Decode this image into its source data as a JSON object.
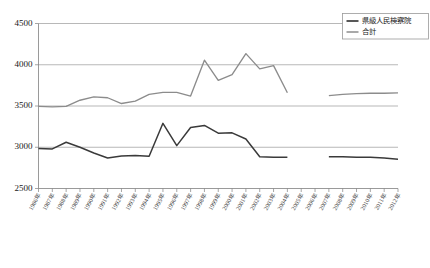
{
  "chart_data": {
    "type": "line",
    "title": "",
    "subtitle": "",
    "xlabel": "",
    "ylabel": "",
    "grid": true,
    "legend_position": "top-right",
    "ylim": [
      2500,
      4500
    ],
    "yticks": [
      "2500",
      "3000",
      "3500",
      "4000",
      "4500"
    ],
    "ytick_values": [
      2500,
      3000,
      3500,
      4000,
      4500
    ],
    "categories": [
      "1986年",
      "1987年",
      "1988年",
      "1989年",
      "1990年",
      "1991年",
      "1992年",
      "1993年",
      "1994年",
      "1995年",
      "1996年",
      "1997年",
      "1998年",
      "1999年",
      "2000年",
      "2001年",
      "2002年",
      "2003年",
      "2004年",
      "2005年",
      "2006年",
      "2007年",
      "2008年",
      "2009年",
      "2010年",
      "2011年",
      "2012年"
    ],
    "series": [
      {
        "name": "県級人民検察院",
        "color": "#3a3a3a",
        "values": [
          2985,
          2980,
          3060,
          3000,
          2930,
          2870,
          2895,
          2900,
          2890,
          3290,
          3020,
          3240,
          3265,
          3170,
          3175,
          3100,
          2885,
          2880,
          2880,
          null,
          null,
          2885,
          2885,
          2880,
          2880,
          2870,
          2855
        ]
      },
      {
        "name": "合計",
        "color": "#8c8c8c",
        "values": [
          3495,
          3490,
          3495,
          3570,
          3610,
          3600,
          3530,
          3560,
          3640,
          3665,
          3665,
          3620,
          4055,
          3810,
          3880,
          4135,
          3950,
          3990,
          3660,
          null,
          null,
          3625,
          3640,
          3650,
          3655,
          3655,
          3660
        ]
      }
    ]
  },
  "legend": {
    "entries": [
      {
        "label": "県級人民検察院"
      },
      {
        "label": "合計"
      }
    ]
  }
}
